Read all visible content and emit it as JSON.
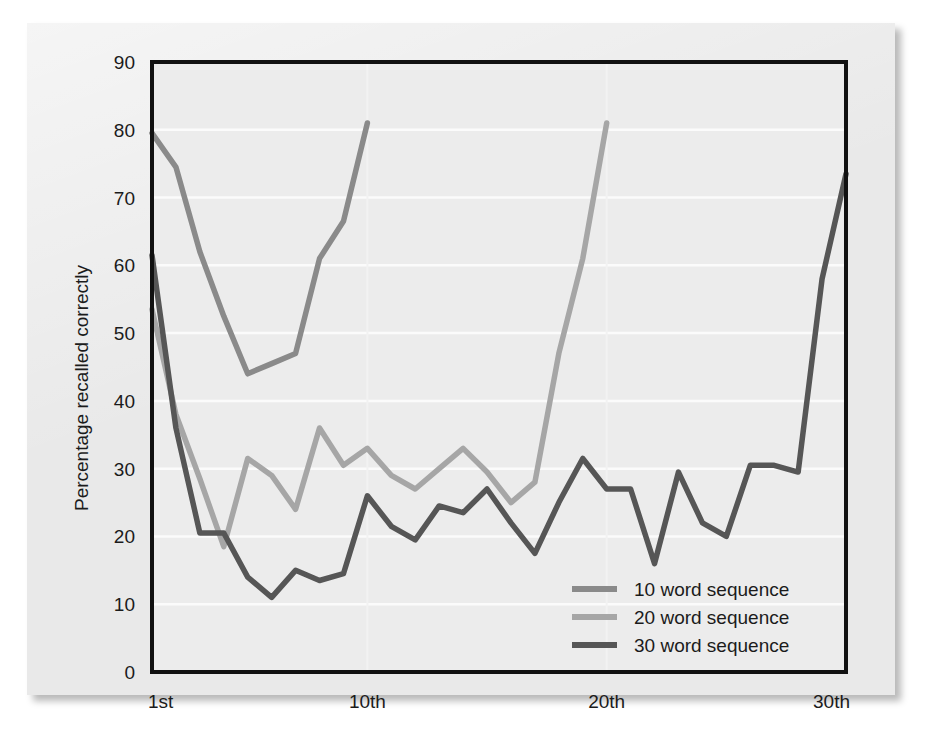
{
  "chart_data": {
    "type": "line",
    "title": "",
    "xlabel": "",
    "ylabel": "Percentage recalled correctly",
    "ylim": [
      0,
      90
    ],
    "xlim": [
      1,
      30
    ],
    "grid": true,
    "grid_orientation": "horizontal",
    "legend_position": "bottom-right",
    "ytick_labels": [
      "0",
      "10",
      "20",
      "30",
      "40",
      "50",
      "60",
      "70",
      "80",
      "90"
    ],
    "ytick_values": [
      0,
      10,
      20,
      30,
      40,
      50,
      60,
      70,
      80,
      90
    ],
    "xtick_labels": [
      "1st",
      "10th",
      "20th",
      "30th"
    ],
    "xtick_values": [
      1,
      10,
      20,
      30
    ],
    "series": [
      {
        "name": "10 word sequence",
        "color": "#8a8a8a",
        "x": [
          1,
          2,
          3,
          4,
          5,
          6,
          7,
          8,
          9,
          10
        ],
        "values": [
          79.5,
          74.5,
          62.0,
          52.5,
          44.0,
          45.5,
          47.0,
          61.0,
          66.5,
          81.0
        ]
      },
      {
        "name": "20 word sequence",
        "color": "#a6a6a6",
        "x": [
          1,
          2,
          3,
          4,
          5,
          6,
          7,
          8,
          9,
          10,
          11,
          12,
          13,
          14,
          15,
          16,
          17,
          18,
          19,
          20
        ],
        "values": [
          53.5,
          38.0,
          28.5,
          18.5,
          31.5,
          29.0,
          24.0,
          36.0,
          30.5,
          33.0,
          29.0,
          27.0,
          30.0,
          33.0,
          29.5,
          25.0,
          28.0,
          47.0,
          61.0,
          81.0
        ]
      },
      {
        "name": "30 word sequence",
        "color": "#565656",
        "x": [
          1,
          2,
          3,
          4,
          5,
          6,
          7,
          8,
          9,
          10,
          11,
          12,
          13,
          14,
          15,
          16,
          17,
          18,
          19,
          20,
          21,
          22,
          23,
          24,
          25,
          26,
          27,
          28,
          29,
          30
        ],
        "values": [
          61.5,
          36.0,
          20.5,
          20.5,
          14.0,
          11.0,
          15.0,
          13.5,
          14.5,
          26.0,
          21.5,
          19.5,
          24.5,
          23.5,
          27.0,
          22.0,
          17.5,
          25.0,
          31.5,
          27.0,
          27.0,
          16.0,
          29.5,
          22.0,
          20.0,
          30.5,
          30.5,
          29.5,
          58.0,
          73.5
        ]
      }
    ]
  },
  "axis": {
    "y_title": "Percentage recalled correctly"
  },
  "legend": {
    "items": [
      {
        "label": "10 word sequence"
      },
      {
        "label": "20 word sequence"
      },
      {
        "label": "30 word sequence"
      }
    ]
  }
}
